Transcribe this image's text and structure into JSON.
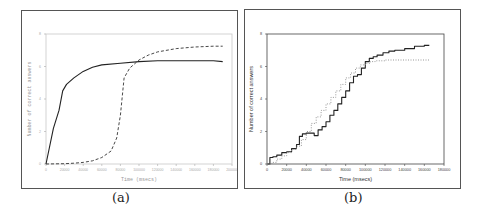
{
  "chart_data": [
    {
      "id": "a",
      "type": "line",
      "caption": "(a)",
      "title": "",
      "xlabel": "Time (msecs)",
      "ylabel": "Number of correct answers",
      "xlim": [
        0,
        200000
      ],
      "ylim": [
        0,
        8
      ],
      "x_ticks": [
        "0",
        "20000",
        "40000",
        "60000",
        "80000",
        "100000",
        "120000",
        "140000",
        "160000",
        "180000",
        "200000"
      ],
      "y_ticks": [
        "0",
        "2",
        "4",
        "6",
        "8"
      ],
      "grid": false,
      "legend": null,
      "series": [
        {
          "name": "solid",
          "style": "solid",
          "x": [
            0,
            8000,
            14000,
            18000,
            22000,
            30000,
            40000,
            50000,
            60000,
            80000,
            100000,
            120000,
            140000,
            160000,
            180000,
            190000
          ],
          "y": [
            0,
            2.2,
            3.3,
            4.5,
            4.9,
            5.3,
            5.7,
            5.95,
            6.1,
            6.2,
            6.3,
            6.35,
            6.35,
            6.35,
            6.35,
            6.3
          ]
        },
        {
          "name": "dashed",
          "style": "dashed",
          "x": [
            0,
            20000,
            30000,
            40000,
            50000,
            60000,
            70000,
            76000,
            80000,
            84000,
            90000,
            100000,
            110000,
            120000,
            140000,
            160000,
            180000,
            190000
          ],
          "y": [
            0,
            0.02,
            0.05,
            0.1,
            0.2,
            0.4,
            0.8,
            1.6,
            3.0,
            5.3,
            5.9,
            6.4,
            6.7,
            6.9,
            7.1,
            7.2,
            7.25,
            7.25
          ]
        }
      ]
    },
    {
      "id": "b",
      "type": "line",
      "caption": "(b)",
      "title": "",
      "xlabel": "Time (msecs)",
      "ylabel": "Number of correct answers",
      "xlim": [
        0,
        180000
      ],
      "ylim": [
        0,
        8
      ],
      "x_ticks": [
        "0",
        "20000",
        "40000",
        "60000",
        "80000",
        "100000",
        "120000",
        "140000",
        "160000",
        "180000"
      ],
      "y_ticks": [
        "0",
        "2",
        "4",
        "6",
        "8"
      ],
      "grid": false,
      "legend": null,
      "series": [
        {
          "name": "solid-step",
          "style": "solid",
          "x": [
            0,
            3000,
            6000,
            10000,
            15000,
            20000,
            25000,
            30000,
            33000,
            36000,
            40000,
            45000,
            48000,
            52000,
            56000,
            60000,
            64000,
            68000,
            72000,
            76000,
            80000,
            84000,
            88000,
            92000,
            96000,
            100000,
            104000,
            108000,
            112000,
            118000,
            124000,
            130000,
            140000,
            150000,
            160000,
            165000
          ],
          "y": [
            0,
            0.4,
            0.45,
            0.55,
            0.7,
            0.75,
            0.95,
            1.2,
            1.7,
            1.85,
            1.9,
            1.9,
            1.75,
            2.1,
            2.3,
            2.6,
            3.0,
            3.3,
            3.7,
            4.1,
            4.5,
            5.0,
            5.4,
            5.5,
            5.9,
            6.3,
            6.5,
            6.6,
            6.7,
            6.85,
            6.95,
            7.0,
            7.1,
            7.25,
            7.3,
            7.3
          ]
        },
        {
          "name": "dotted-step",
          "style": "dotted",
          "x": [
            0,
            5000,
            10000,
            15000,
            20000,
            25000,
            30000,
            35000,
            40000,
            45000,
            50000,
            55000,
            60000,
            65000,
            70000,
            75000,
            80000,
            85000,
            90000,
            95000,
            100000,
            105000,
            110000,
            120000,
            140000,
            160000,
            165000
          ],
          "y": [
            0,
            0.1,
            0.3,
            0.5,
            0.7,
            0.9,
            1.1,
            1.5,
            2.0,
            2.5,
            2.9,
            3.3,
            3.7,
            4.1,
            4.5,
            4.9,
            5.3,
            5.6,
            5.9,
            6.1,
            6.2,
            6.3,
            6.35,
            6.4,
            6.4,
            6.4,
            6.4
          ]
        }
      ]
    }
  ],
  "figure": {
    "caption_a": "(a)",
    "caption_b": "(b)",
    "a_xlabel": "Time (msecs)",
    "a_ylabel": "Number of correct answers",
    "b_xlabel": "Time (msecs)",
    "b_ylabel": "Number of correct answers"
  }
}
